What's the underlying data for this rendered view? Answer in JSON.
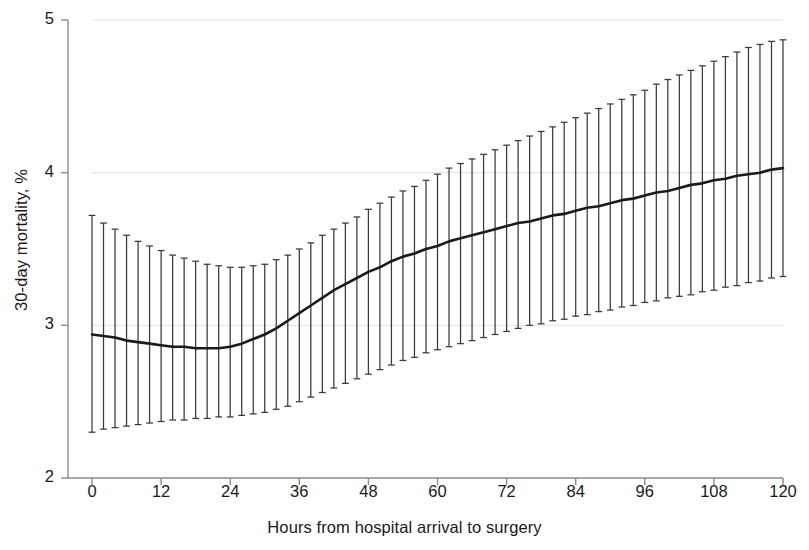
{
  "chart_data": {
    "type": "line",
    "title": "",
    "subtitle": "",
    "xlabel": "Hours from hospital arrival to surgery",
    "ylabel": "30-day mortality, %",
    "xlim": [
      0,
      120
    ],
    "ylim": [
      2,
      5
    ],
    "xticks": [
      0,
      12,
      24,
      36,
      48,
      60,
      72,
      84,
      96,
      108,
      120
    ],
    "xtick_labels": [
      "0",
      "12",
      "24",
      "36",
      "48",
      "60",
      "72",
      "84",
      "96",
      "108",
      "120"
    ],
    "yticks": [
      2,
      3,
      4,
      5
    ],
    "ytick_labels": [
      "2",
      "3",
      "4",
      "5"
    ],
    "grid": "horizontal-faint",
    "legend": "none",
    "annotations": [],
    "series": [
      {
        "name": "Adjusted 30-day mortality",
        "type": "line-with-errorbars",
        "line_color": "#1a1a1a",
        "errorbar_color": "#3a3a3a",
        "errorbar_caps": true,
        "x": [
          0,
          2,
          4,
          6,
          8,
          10,
          12,
          14,
          16,
          18,
          20,
          22,
          24,
          26,
          28,
          30,
          32,
          34,
          36,
          38,
          40,
          42,
          44,
          46,
          48,
          50,
          52,
          54,
          56,
          58,
          60,
          62,
          64,
          66,
          68,
          70,
          72,
          74,
          76,
          78,
          80,
          82,
          84,
          86,
          88,
          90,
          92,
          94,
          96,
          98,
          100,
          102,
          104,
          106,
          108,
          110,
          112,
          114,
          116,
          118,
          120
        ],
        "y": [
          2.94,
          2.93,
          2.92,
          2.9,
          2.89,
          2.88,
          2.87,
          2.86,
          2.86,
          2.85,
          2.85,
          2.85,
          2.86,
          2.88,
          2.91,
          2.94,
          2.98,
          3.03,
          3.08,
          3.13,
          3.18,
          3.23,
          3.27,
          3.31,
          3.35,
          3.38,
          3.42,
          3.45,
          3.47,
          3.5,
          3.52,
          3.55,
          3.57,
          3.59,
          3.61,
          3.63,
          3.65,
          3.67,
          3.68,
          3.7,
          3.72,
          3.73,
          3.75,
          3.77,
          3.78,
          3.8,
          3.82,
          3.83,
          3.85,
          3.87,
          3.88,
          3.9,
          3.92,
          3.93,
          3.95,
          3.96,
          3.98,
          3.99,
          4.0,
          4.02,
          4.03
        ],
        "ci_upper": [
          3.72,
          3.67,
          3.63,
          3.59,
          3.55,
          3.52,
          3.49,
          3.46,
          3.44,
          3.42,
          3.4,
          3.39,
          3.38,
          3.38,
          3.39,
          3.4,
          3.43,
          3.46,
          3.5,
          3.54,
          3.59,
          3.63,
          3.67,
          3.71,
          3.76,
          3.8,
          3.84,
          3.88,
          3.91,
          3.95,
          3.99,
          4.03,
          4.06,
          4.09,
          4.12,
          4.15,
          4.18,
          4.21,
          4.24,
          4.27,
          4.3,
          4.33,
          4.36,
          4.39,
          4.42,
          4.45,
          4.48,
          4.51,
          4.54,
          4.58,
          4.61,
          4.64,
          4.67,
          4.7,
          4.73,
          4.76,
          4.79,
          4.82,
          4.84,
          4.86,
          4.87
        ],
        "ci_lower": [
          2.3,
          2.32,
          2.33,
          2.34,
          2.35,
          2.36,
          2.37,
          2.38,
          2.38,
          2.39,
          2.39,
          2.4,
          2.4,
          2.41,
          2.42,
          2.43,
          2.45,
          2.47,
          2.5,
          2.53,
          2.56,
          2.59,
          2.62,
          2.65,
          2.68,
          2.71,
          2.74,
          2.77,
          2.79,
          2.82,
          2.84,
          2.86,
          2.88,
          2.9,
          2.92,
          2.94,
          2.96,
          2.98,
          3.0,
          3.01,
          3.03,
          3.04,
          3.06,
          3.07,
          3.09,
          3.1,
          3.12,
          3.13,
          3.15,
          3.16,
          3.18,
          3.19,
          3.2,
          3.22,
          3.23,
          3.25,
          3.26,
          3.28,
          3.29,
          3.31,
          3.32
        ]
      }
    ]
  }
}
